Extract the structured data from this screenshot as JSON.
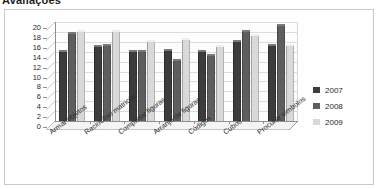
{
  "heading": {
    "text": "Avaliações"
  },
  "legend": {
    "position": "right",
    "entries": [
      {
        "label": "2007",
        "color": "#3c3c3c"
      },
      {
        "label": "2008",
        "color": "#5e5e5e"
      },
      {
        "label": "2009",
        "color": "#d9d9d9"
      }
    ]
  },
  "axis": {
    "y_ticks": [
      "20",
      "18",
      "16",
      "14",
      "12",
      "10",
      "8",
      "6",
      "4",
      "2",
      "0"
    ]
  },
  "chart_data": {
    "type": "bar",
    "title": "Avaliações",
    "xlabel": "",
    "ylabel": "",
    "ylim": [
      0,
      20
    ],
    "ytick_step": 2,
    "grid": true,
    "legend_position": "right",
    "categories": [
      "Armar objetos",
      "Raciocínio matricial",
      "Completar figuras",
      "Arranjo de figuras",
      "Códigos",
      "Cubos",
      "Procurar símbolos"
    ],
    "series": [
      {
        "name": "2007",
        "color": "#3c3c3c",
        "values": [
          14.3,
          15.3,
          14.3,
          14.5,
          14.4,
          16.4,
          15.5
        ]
      },
      {
        "name": "2008",
        "color": "#5e5e5e",
        "values": [
          18.0,
          15.5,
          14.4,
          12.5,
          13.5,
          18.3,
          19.6
        ]
      },
      {
        "name": "2009",
        "color": "#d9d9d9",
        "values": [
          18.3,
          18.3,
          16.3,
          16.7,
          15.4,
          17.5,
          15.5
        ]
      }
    ]
  }
}
